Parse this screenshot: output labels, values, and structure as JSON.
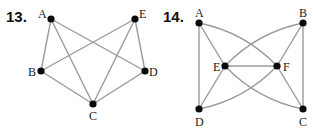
{
  "problems": [
    {
      "number": "13.",
      "nodes": [
        {
          "id": "A",
          "x": 51,
          "y": 19,
          "lx": 38,
          "ly": 18
        },
        {
          "id": "E",
          "x": 135,
          "y": 19,
          "lx": 139,
          "ly": 18
        },
        {
          "id": "B",
          "x": 41,
          "y": 71,
          "lx": 28,
          "ly": 76
        },
        {
          "id": "D",
          "x": 145,
          "y": 71,
          "lx": 149,
          "ly": 76
        },
        {
          "id": "C",
          "x": 93,
          "y": 104,
          "lx": 89,
          "ly": 120
        }
      ],
      "edges": [
        [
          "A",
          "B"
        ],
        [
          "A",
          "C"
        ],
        [
          "A",
          "D"
        ],
        [
          "E",
          "B"
        ],
        [
          "E",
          "C"
        ],
        [
          "E",
          "D"
        ],
        [
          "B",
          "C"
        ],
        [
          "C",
          "D"
        ]
      ]
    },
    {
      "number": "14.",
      "nodes": [
        {
          "id": "A",
          "x": 199,
          "y": 23,
          "lx": 195,
          "ly": 17
        },
        {
          "id": "B",
          "x": 303,
          "y": 23,
          "lx": 299,
          "ly": 17
        },
        {
          "id": "E",
          "x": 225,
          "y": 66,
          "lx": 213,
          "ly": 71
        },
        {
          "id": "F",
          "x": 277,
          "y": 66,
          "lx": 283,
          "ly": 71
        },
        {
          "id": "D",
          "x": 199,
          "y": 109,
          "lx": 195,
          "ly": 126
        },
        {
          "id": "C",
          "x": 303,
          "y": 109,
          "lx": 299,
          "ly": 126
        }
      ],
      "edges": [
        [
          "A",
          "D"
        ],
        [
          "A",
          "E"
        ],
        [
          "B",
          "C"
        ],
        [
          "B",
          "F"
        ],
        [
          "E",
          "F"
        ],
        [
          "E",
          "D"
        ],
        [
          "F",
          "C"
        ]
      ],
      "curved_edges": [
        [
          "A",
          "F"
        ],
        [
          "E",
          "C"
        ],
        [
          "E",
          "B"
        ],
        [
          "D",
          "F"
        ]
      ]
    }
  ]
}
